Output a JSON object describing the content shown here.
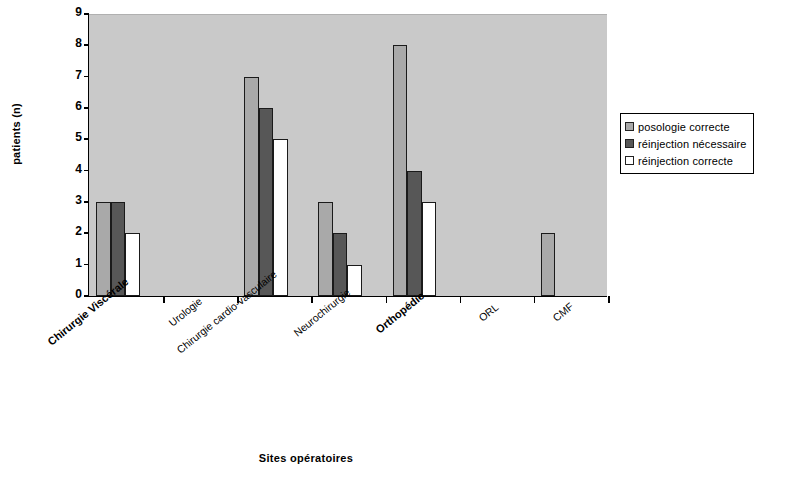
{
  "chart_data": {
    "type": "bar",
    "title": "",
    "subtitle": "",
    "xlabel": "Sites opératoires",
    "ylabel": "patients (n)",
    "ylim": [
      0,
      9
    ],
    "ytick_labels": [
      "0",
      "1",
      "2",
      "3",
      "4",
      "5",
      "6",
      "7",
      "8",
      "9"
    ],
    "grid": false,
    "legend_position": "right",
    "categories": [
      "Chirurgie Viscérale",
      "Urologie",
      "Chirurgie cardio-vasculaire",
      "Neurochirurgie",
      "Orthopédie",
      "ORL",
      "CMF"
    ],
    "series": [
      {
        "name": "posologie correcte",
        "color": "#a9a9a9",
        "values": [
          3,
          0,
          7,
          3,
          8,
          0,
          2
        ]
      },
      {
        "name": "réinjection nécessaire",
        "color": "#575757",
        "values": [
          3,
          0,
          6,
          2,
          4,
          0,
          0
        ]
      },
      {
        "name": "réinjection correcte",
        "color": "#ffffff",
        "values": [
          2,
          0,
          5,
          1,
          3,
          0,
          0
        ]
      }
    ]
  },
  "axes": {
    "y_title": "patients (n)",
    "x_title": "Sites opératoires"
  },
  "legend": {
    "items": [
      {
        "label": "posologie correcte",
        "swatch": "#a9a9a9"
      },
      {
        "label": "réinjection nécessaire",
        "swatch": "#575757"
      },
      {
        "label": "réinjection correcte",
        "swatch": "#ffffff"
      }
    ]
  },
  "style": {
    "plot_background": "#c9c9c9",
    "page_background": "#ffffff",
    "axis_color": "#000000"
  },
  "emphasis": {
    "bold_categories": [
      "Chirurgie Viscérale",
      "Orthopédie"
    ]
  }
}
